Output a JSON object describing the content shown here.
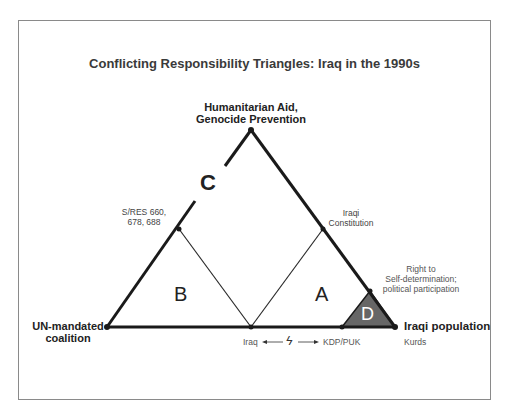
{
  "title": "Conflicting Responsibility Triangles: Iraq in the 1990s",
  "vertices": {
    "top": "Humanitarian Aid,\nGenocide Prevention",
    "top_line1": "Humanitarian Aid,",
    "top_line2": "Genocide Prevention",
    "left_line1": "UN-mandated",
    "left_line2": "coalition",
    "right": "Iraqi population",
    "right_sub": "Kurds"
  },
  "edge_points": {
    "left_edge_line1": "S/RES 660,",
    "left_edge_line2": "678, 688",
    "right_edge_line1": "Iraqi",
    "right_edge_line2": "Constitution",
    "right_edge_lower_line1": "Right to",
    "right_edge_lower_line2": "Self-determination;",
    "right_edge_lower_line3": "political participation",
    "base_mid": "Iraq",
    "base_right": "KDP/PUK",
    "conflict_symbol": "ϟ"
  },
  "regions": {
    "A": "A",
    "B": "B",
    "C": "C",
    "D": "D"
  },
  "colors": {
    "line": "#1a1a1a",
    "thin_line": "#2a2a2a",
    "d_fill": "#666666",
    "frame": "#8a8a8a",
    "gray_text": "#555555"
  }
}
